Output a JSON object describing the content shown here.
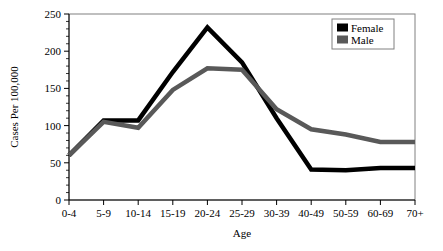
{
  "chart_data": {
    "type": "line",
    "title": "",
    "xlabel": "Age",
    "ylabel": "Cases Per 100,000",
    "categories": [
      "0-4",
      "5-9",
      "10-14",
      "15-19",
      "20-24",
      "25-29",
      "30-39",
      "40-49",
      "50-59",
      "60-69",
      "70+"
    ],
    "ylim": [
      0,
      250
    ],
    "yticks": [
      0,
      50,
      100,
      150,
      200,
      250
    ],
    "ytick_labels": [
      "0",
      "50",
      "100",
      "150",
      "200",
      "250"
    ],
    "grid": false,
    "legend_position": "top-right",
    "series": [
      {
        "name": "Female",
        "color": "#000000",
        "values": [
          60,
          107,
          107,
          172,
          232,
          185,
          110,
          41,
          40,
          43,
          43
        ]
      },
      {
        "name": "Male",
        "color": "#595959",
        "values": [
          60,
          105,
          97,
          148,
          177,
          175,
          122,
          95,
          88,
          78,
          78
        ]
      }
    ]
  },
  "legend": {
    "items": [
      {
        "label": "Female",
        "swatch_color": "#000000"
      },
      {
        "label": "Male",
        "swatch_color": "#595959"
      }
    ]
  },
  "axes": {
    "x_title": "Age",
    "y_title": "Cases Per 100,000"
  }
}
